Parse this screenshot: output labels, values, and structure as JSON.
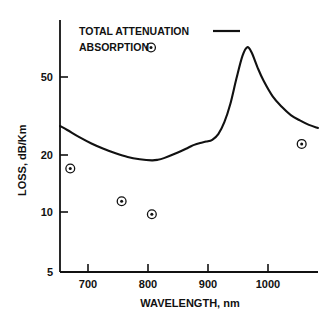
{
  "figure": {
    "background": "#ffffff",
    "ink": "#111111"
  },
  "legend": {
    "position": "top-left-inside",
    "entries": [
      {
        "label": "TOTAL  ATTENUATION",
        "marker": "line-segment-icon"
      },
      {
        "label": "ABSORPTION",
        "marker": "circle-dot-marker-icon"
      }
    ]
  },
  "axes": {
    "x": {
      "label": "WAVELENGTH,  nm",
      "ticks": [
        "700",
        "800",
        "900",
        "1000"
      ],
      "tick_values": [
        700,
        800,
        900,
        1000
      ],
      "range": [
        648,
        1075
      ],
      "scale": "linear"
    },
    "y": {
      "label": "LOSS,  dB/Km",
      "ticks": [
        "50",
        "20",
        "10",
        "5"
      ],
      "tick_values": [
        50,
        20,
        10,
        5
      ],
      "range": [
        5,
        75
      ],
      "scale": "log"
    }
  },
  "chart_data": {
    "type": "line",
    "title": "",
    "subtitle": "",
    "xlabel": "WAVELENGTH,  nm",
    "ylabel": "LOSS,  dB/Km",
    "xlim": [
      648,
      1075
    ],
    "ylim": [
      5,
      75
    ],
    "yscale": "log",
    "xscale": "linear",
    "grid": false,
    "legend_position": "upper left",
    "series": [
      {
        "name": "TOTAL  ATTENUATION",
        "type": "line",
        "style": "solid",
        "color": "#111111",
        "x": [
          648,
          660,
          680,
          700,
          720,
          740,
          760,
          780,
          800,
          810,
          820,
          840,
          860,
          870,
          880,
          890,
          900,
          910,
          920,
          930,
          940,
          950,
          958,
          965,
          975,
          985,
          1000,
          1015,
          1030,
          1045,
          1060,
          1075
        ],
        "y": [
          24.0,
          23.0,
          21.3,
          19.9,
          18.8,
          17.9,
          17.2,
          16.8,
          16.6,
          16.7,
          17.0,
          17.9,
          19.0,
          19.6,
          20.0,
          20.3,
          20.7,
          22.0,
          25.0,
          30.5,
          40.0,
          51.0,
          56.0,
          53.0,
          45.0,
          39.0,
          33.0,
          29.5,
          27.0,
          25.5,
          24.3,
          23.5
        ]
      },
      {
        "name": "ABSORPTION",
        "type": "scatter",
        "marker": "circle-dot-marker-icon",
        "color": "#111111",
        "x": [
          665,
          750,
          800,
          1048
        ],
        "y": [
          15.2,
          10.7,
          9.3,
          19.8
        ]
      }
    ]
  }
}
